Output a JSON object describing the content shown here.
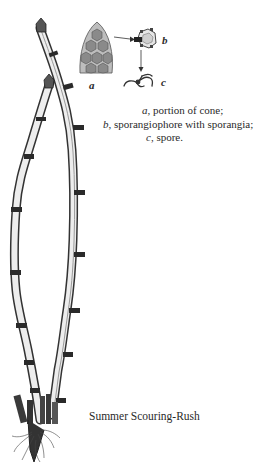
{
  "figure": {
    "caption": "Summer Scouring-Rush",
    "insets": {
      "a_label": "a",
      "b_label": "b",
      "c_label": "c"
    },
    "legend": [
      {
        "letter": "a",
        "text": ", portion of cone;"
      },
      {
        "letter": "b",
        "text": ", sporangiophore with sporangia;"
      },
      {
        "letter": "c",
        "text": ", spore."
      }
    ]
  }
}
